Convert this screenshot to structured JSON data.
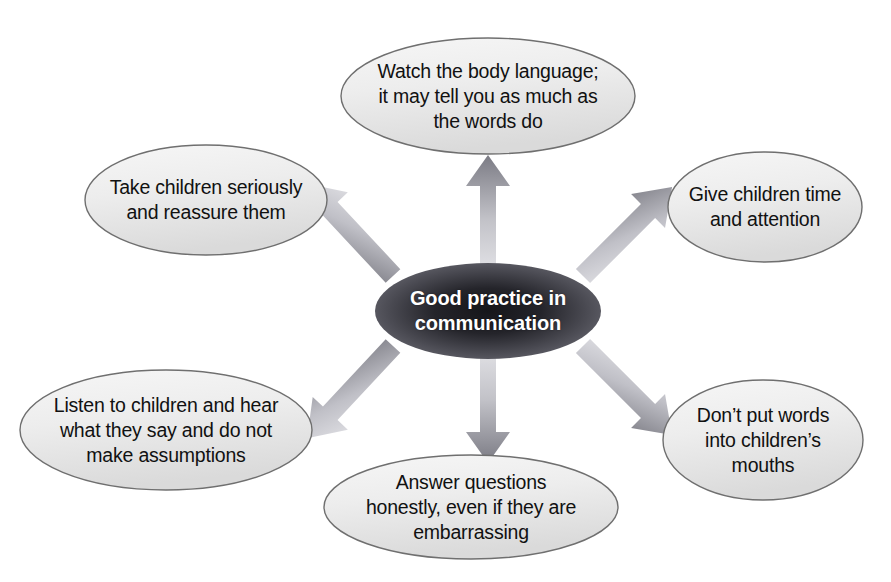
{
  "diagram": {
    "title": "Good practice in communication",
    "type": "hub-and-spoke",
    "colors": {
      "background": "#ffffff",
      "node_fill_light": "#f3f3f3",
      "node_fill_dark": "#dcdcdc",
      "node_stroke": "#6f6f6f",
      "center_fill_outer": "#5a5a62",
      "center_fill_inner": "#1d1d22",
      "center_text": "#ffffff",
      "node_text": "#111111",
      "arrow_tip": "#7e7e86",
      "arrow_base": "#d8d8dc"
    },
    "center": {
      "label": "Good practice in\ncommunication",
      "cx": 488,
      "cy": 311,
      "rx": 113,
      "ry": 48
    },
    "nodes": [
      {
        "id": "body-language",
        "label": "Watch the body language;\nit may tell you as much as\nthe words do",
        "cx": 488,
        "cy": 96,
        "rx": 147,
        "ry": 58,
        "direction": "up"
      },
      {
        "id": "take-seriously",
        "label": "Take children seriously\nand reassure them",
        "cx": 206,
        "cy": 200,
        "rx": 121,
        "ry": 55,
        "direction": "up-left"
      },
      {
        "id": "give-time",
        "label": "Give children time\nand attention",
        "cx": 765,
        "cy": 207,
        "rx": 97,
        "ry": 55,
        "direction": "up-right"
      },
      {
        "id": "listen",
        "label": "Listen to children and hear\nwhat they say and do not\nmake assumptions",
        "cx": 166,
        "cy": 430,
        "rx": 146,
        "ry": 60,
        "direction": "down-left"
      },
      {
        "id": "dont-put-words",
        "label": "Don’t put words\ninto children’s\nmouths",
        "cx": 763,
        "cy": 440,
        "rx": 100,
        "ry": 60,
        "direction": "down-right"
      },
      {
        "id": "answer-questions",
        "label": "Answer questions\nhonestly, even if they are\nembarrassing",
        "cx": 471,
        "cy": 507,
        "rx": 147,
        "ry": 52,
        "direction": "down"
      }
    ],
    "arrows": [
      {
        "id": "arrow-up",
        "to": "body-language"
      },
      {
        "id": "arrow-up-left",
        "to": "take-seriously"
      },
      {
        "id": "arrow-up-right",
        "to": "give-time"
      },
      {
        "id": "arrow-down-left",
        "to": "listen"
      },
      {
        "id": "arrow-down-right",
        "to": "dont-put-words"
      },
      {
        "id": "arrow-down",
        "to": "answer-questions"
      }
    ]
  }
}
